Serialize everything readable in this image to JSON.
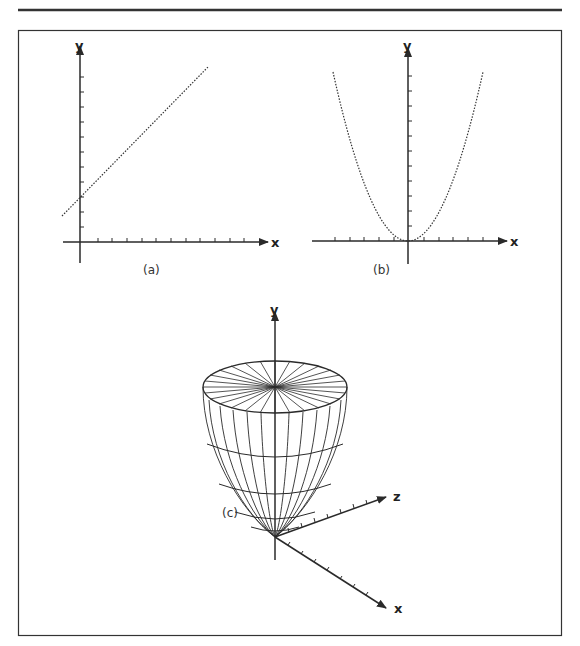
{
  "figure": {
    "panels": [
      {
        "id": "a",
        "caption": "(a)",
        "type": "2d-graph",
        "axes": {
          "x_label": "x",
          "y_label": "y",
          "x_ticks": 11,
          "y_ticks": 11
        },
        "curve": {
          "kind": "line",
          "style": "dotted",
          "description": "straight line with positive slope and positive y-intercept"
        }
      },
      {
        "id": "b",
        "caption": "(b)",
        "type": "2d-graph",
        "axes": {
          "x_label": "x",
          "y_label": "y",
          "x_ticks": 10,
          "y_ticks": 11
        },
        "curve": {
          "kind": "parabola",
          "style": "dotted",
          "description": "upward-opening parabola with vertex at origin"
        }
      },
      {
        "id": "c",
        "caption": "(c)",
        "type": "3d-surface",
        "axes": {
          "x_label": "x",
          "y_label": "y",
          "z_label": "z"
        },
        "surface": {
          "kind": "paraboloid",
          "style": "wireframe",
          "description": "paraboloid of revolution about the y-axis with vertex at origin"
        }
      }
    ]
  },
  "colors": {
    "ink": "#2a2a2a",
    "background": "#ffffff"
  }
}
